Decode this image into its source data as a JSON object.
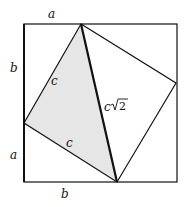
{
  "diagram": {
    "type": "geometry",
    "labels": {
      "top": "a",
      "left_upper": "b",
      "left_lower": "a",
      "bottom": "b",
      "leg_upper": "c",
      "leg_lower": "c",
      "hypotenuse_c": "c",
      "hypotenuse_root": "2"
    },
    "colors": {
      "stroke": "#111111",
      "shade": "#e6e6e6",
      "background": "#ffffff"
    }
  }
}
